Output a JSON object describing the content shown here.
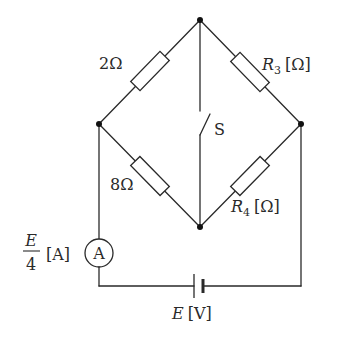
{
  "diagram": {
    "type": "wheatstone-bridge-circuit",
    "nodes": {
      "top": {
        "x": 200,
        "y": 20
      },
      "left": {
        "x": 99,
        "y": 124
      },
      "right": {
        "x": 301,
        "y": 124
      },
      "bottom": {
        "x": 200,
        "y": 227
      }
    },
    "resistors": [
      {
        "id": "r1",
        "label": "2Ω",
        "value": "2",
        "unit": "Ω",
        "between": [
          "left",
          "top"
        ]
      },
      {
        "id": "r2",
        "label": "8Ω",
        "value": "8",
        "unit": "Ω",
        "between": [
          "left",
          "bottom"
        ]
      },
      {
        "id": "r3",
        "symbol": "R",
        "subscript": "3",
        "unit_label": "[Ω]",
        "between": [
          "top",
          "right"
        ]
      },
      {
        "id": "r4",
        "symbol": "R",
        "subscript": "4",
        "unit_label": "[Ω]",
        "between": [
          "bottom",
          "right"
        ]
      }
    ],
    "switch": {
      "label": "S",
      "between": [
        "top",
        "bottom"
      ],
      "state": "open"
    },
    "ammeter": {
      "symbol": "A",
      "reading_numerator": "E",
      "reading_denominator": "4",
      "reading_unit": "[A]"
    },
    "battery": {
      "symbol": "E",
      "unit_label": "[V]"
    }
  },
  "labels": {
    "r1": "2Ω",
    "r2": "8Ω",
    "r3_symbol": "R",
    "r3_sub": "3",
    "r3_unit": "[Ω]",
    "r4_symbol": "R",
    "r4_sub": "4",
    "r4_unit": "[Ω]",
    "switch": "S",
    "ammeter_symbol": "A",
    "ammeter_num": "E",
    "ammeter_den": "4",
    "ammeter_unit": "[A]",
    "battery_symbol": "E",
    "battery_unit": "[V]"
  }
}
